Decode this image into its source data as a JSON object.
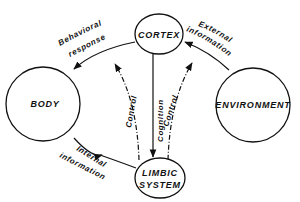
{
  "nodes": {
    "cortex": {
      "label": "CORTEX"
    },
    "limbic": {
      "label_line1": "LIMBIC",
      "label_line2": "SYSTEM"
    },
    "body": {
      "label": "BODY"
    },
    "environment": {
      "label": "ENVIRONMENT"
    }
  },
  "edges": {
    "behavioral_response": {
      "line1": "Behavioral",
      "line2": "response",
      "from": "CORTEX",
      "to": "BODY"
    },
    "external_information": {
      "line1": "External",
      "line2": "information",
      "from": "ENVIRONMENT",
      "to": "CORTEX"
    },
    "internal_information": {
      "line1": "Internal",
      "line2": "information",
      "from": "BODY",
      "to": "LIMBIC SYSTEM"
    },
    "cognition": {
      "label": "Cognition",
      "from": "CORTEX",
      "to": "LIMBIC SYSTEM"
    },
    "control_left": {
      "label": "Control",
      "from": "LIMBIC SYSTEM",
      "to": "CORTEX",
      "style": "dashed"
    },
    "control_right": {
      "label": "Control",
      "from": "LIMBIC SYSTEM",
      "to": "CORTEX",
      "style": "dashed"
    }
  },
  "colors": {
    "ink": "#111111",
    "background": "#ffffff"
  }
}
